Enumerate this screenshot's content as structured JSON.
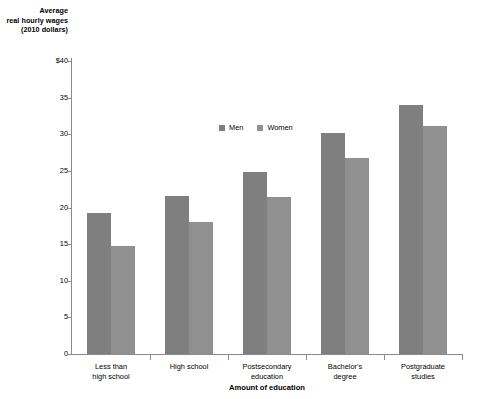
{
  "chart_data": {
    "type": "bar",
    "title": "",
    "ylabel": "Average real hourly wages (2010 dollars)",
    "xlabel": "Amount of education",
    "categories": [
      "Less than\nhigh school",
      "High school",
      "Postsecondary\neducation",
      "Bachelor's\ndegree",
      "Postgraduate\nstudies"
    ],
    "series": [
      {
        "name": "Men",
        "color": "#7f7f7f",
        "values": [
          19.3,
          21.6,
          24.8,
          30.2,
          34.0
        ]
      },
      {
        "name": "Women",
        "color": "#909090",
        "values": [
          14.8,
          18.0,
          21.4,
          26.7,
          31.1
        ]
      }
    ],
    "ylim": [
      0,
      40
    ],
    "ytick_values": [
      0,
      5,
      10,
      15,
      20,
      25,
      30,
      35,
      40
    ],
    "ytick_labels": [
      "0",
      "5",
      "10",
      "15",
      "20",
      "25",
      "30",
      "35",
      "$40"
    ],
    "grid": false,
    "legend_position": "inside-upper-center"
  },
  "axis": {
    "y_title_line1": "Average",
    "y_title_line2": "real hourly wages",
    "y_title_line3": "(2010 dollars)",
    "x_title": "Amount of education"
  },
  "legend": {
    "items": [
      {
        "label": "Men"
      },
      {
        "label": "Women"
      }
    ]
  },
  "categories_display": [
    {
      "line1": "Less than",
      "line2": "high school"
    },
    {
      "line1": "High school",
      "line2": ""
    },
    {
      "line1": "Postsecondary",
      "line2": "education"
    },
    {
      "line1": "Bachelor's",
      "line2": "degree"
    },
    {
      "line1": "Postgraduate",
      "line2": "studies"
    }
  ],
  "colors": {
    "men": "#7f7f7f",
    "women": "#909090",
    "axis": "#8a8a8a",
    "background": "#ffffff",
    "text": "#000000"
  }
}
